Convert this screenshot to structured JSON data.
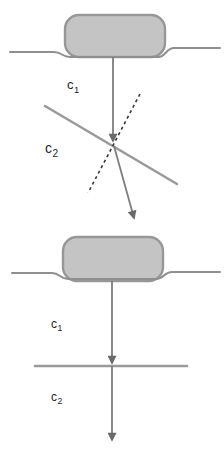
{
  "figure": {
    "panels": [
      {
        "position": "top",
        "interface_type": "dipping",
        "labels": {
          "upper_medium": {
            "base": "c",
            "sub": "1"
          },
          "lower_medium": {
            "base": "c",
            "sub": "2"
          }
        }
      },
      {
        "position": "bottom",
        "interface_type": "horizontal",
        "labels": {
          "upper_medium": {
            "base": "c",
            "sub": "1"
          },
          "lower_medium": {
            "base": "c",
            "sub": "2"
          }
        }
      }
    ],
    "colors": {
      "background": "#ffffff",
      "source_fill": "#c4c4c4",
      "source_stroke": "#979797",
      "surface_line": "#8f8f8f",
      "interface_line": "#9a9a9a",
      "ray": "#7d7d7d",
      "arrowhead": "#6a6a6a",
      "normal_dashed": "#383838",
      "label_text": "#242424"
    }
  }
}
